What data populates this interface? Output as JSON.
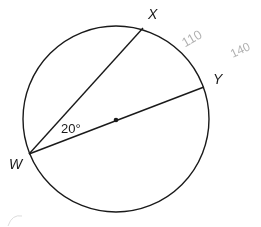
{
  "diagram": {
    "type": "circle-geometry",
    "circle": {
      "cx": 116,
      "cy": 119,
      "r": 93,
      "stroke": "#1a1a1a"
    },
    "center_point": {
      "x": 116,
      "y": 120
    },
    "points": [
      {
        "id": "W",
        "label": "W",
        "x": 29,
        "y": 154,
        "label_x": 9,
        "label_y": 169
      },
      {
        "id": "X",
        "label": "X",
        "x": 143,
        "y": 28,
        "label_x": 148,
        "label_y": 18
      },
      {
        "id": "Y",
        "label": "Y",
        "x": 204,
        "y": 87,
        "label_x": 213,
        "label_y": 83
      }
    ],
    "segments": [
      {
        "from": "W",
        "to": "X",
        "name": "chord-wx"
      },
      {
        "from": "W",
        "to": "Y",
        "name": "diameter-wy"
      }
    ],
    "angle_label": {
      "text": "20°",
      "x": 61,
      "y": 133,
      "vertex": "W"
    },
    "handwritten_notes": [
      {
        "text": "110",
        "x": 182,
        "y": 44
      },
      {
        "text": "140",
        "x": 230,
        "y": 55
      }
    ]
  }
}
